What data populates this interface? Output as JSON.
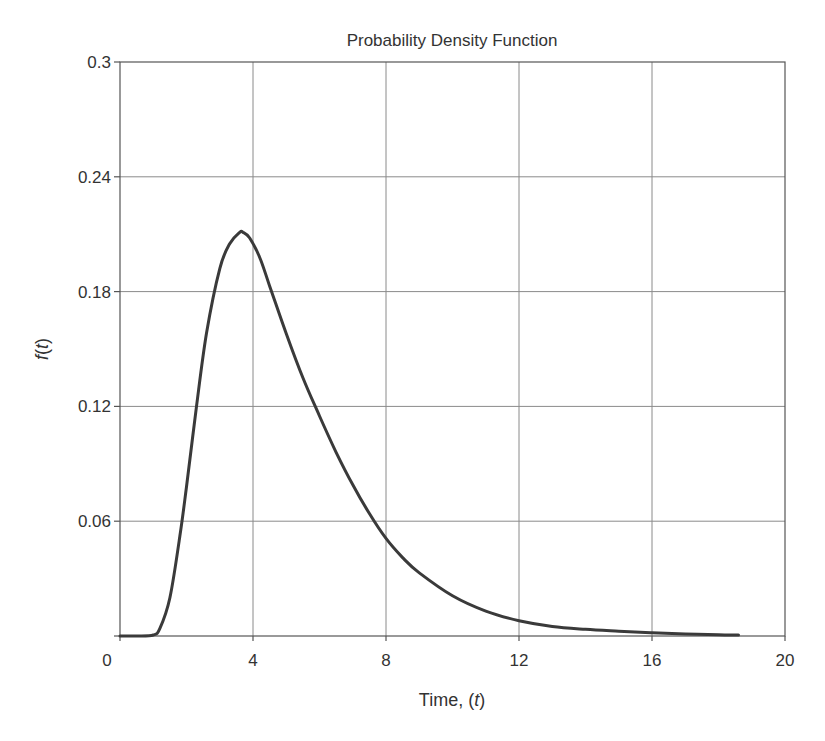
{
  "chart_data": {
    "type": "line",
    "title": "Probability Density Function",
    "xlabel": "Time, (t)",
    "xlabel_parts": [
      "Time, (",
      "t",
      ")"
    ],
    "ylabel": "f(t)",
    "ylabel_parts": [
      "f",
      "(",
      "t",
      ")"
    ],
    "xlim": [
      0,
      20
    ],
    "ylim": [
      0,
      0.3
    ],
    "xticks": [
      0,
      4,
      8,
      12,
      16,
      20
    ],
    "xtick_labels": [
      "0",
      "4",
      "8",
      "12",
      "16",
      "20"
    ],
    "yticks": [
      0.06,
      0.12,
      0.18,
      0.24,
      0.3
    ],
    "ytick_labels": [
      "0.06",
      "0.12",
      "0.18",
      "0.24",
      "0.3"
    ],
    "grid": true,
    "legend": null,
    "series": [
      {
        "name": "f(t)",
        "color": "#3a3a3a",
        "x": [
          0,
          0.5,
          1.0,
          1.2,
          1.5,
          1.8,
          2.0,
          2.3,
          2.6,
          3.0,
          3.3,
          3.6,
          3.7,
          3.9,
          4.2,
          4.5,
          5.0,
          5.5,
          6.0,
          6.5,
          7.0,
          7.5,
          8.0,
          8.5,
          9.0,
          10.0,
          11.0,
          12.0,
          13.0,
          14.0,
          15.0,
          16.0,
          17.0,
          18.0,
          18.6
        ],
        "y": [
          0,
          0,
          0.0005,
          0.004,
          0.02,
          0.052,
          0.078,
          0.12,
          0.158,
          0.192,
          0.205,
          0.211,
          0.211,
          0.208,
          0.198,
          0.183,
          0.158,
          0.135,
          0.115,
          0.096,
          0.079,
          0.064,
          0.051,
          0.041,
          0.033,
          0.021,
          0.013,
          0.008,
          0.005,
          0.0035,
          0.0025,
          0.0017,
          0.0011,
          0.0007,
          0.0005
        ]
      }
    ],
    "peak": {
      "x": 3.7,
      "y": 0.211
    }
  }
}
